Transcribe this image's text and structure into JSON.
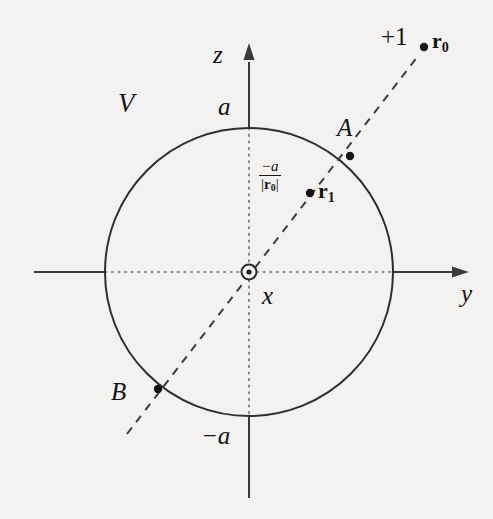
{
  "figure": {
    "background_color": "#f3f2f0",
    "ink_color": "#1a1a1a",
    "width": 493,
    "height": 519
  },
  "axes": {
    "z_label": "z",
    "y_label": "y",
    "x_label": "x",
    "origin_symbol": "out-of-page-dot"
  },
  "sphere": {
    "region_label": "V",
    "radius_label_top": "a",
    "radius_label_bottom": "−a",
    "center": {
      "cx": 249,
      "cy": 272
    },
    "radius": 144
  },
  "points": [
    {
      "id": "A",
      "label": "A",
      "x": 350,
      "y": 156,
      "on": "sphere-surface"
    },
    {
      "id": "B",
      "label": "B",
      "x": 158,
      "y": 389,
      "on": "sphere-surface"
    },
    {
      "id": "r0",
      "label": "r",
      "subscript": "0",
      "charge_label": "+1",
      "x": 424,
      "y": 47,
      "on": "outside"
    },
    {
      "id": "r1",
      "label": "r",
      "subscript": "1",
      "x": 310,
      "y": 193,
      "on": "inside"
    }
  ],
  "image_charge": {
    "numerator": "−a",
    "denominator_prefix": "|",
    "denominator_symbol": "r",
    "denominator_subscript": "0",
    "denominator_suffix": "|"
  }
}
